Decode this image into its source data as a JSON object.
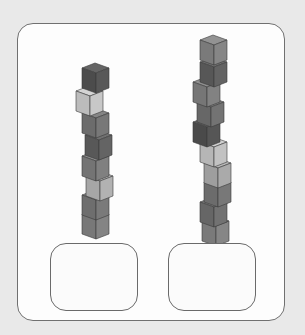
{
  "worksheet": {
    "towers": [
      {
        "name": "left-tower",
        "count": 8,
        "cubes": [
          {
            "x": 82,
            "y": 63,
            "shade": "#4c4c4c"
          },
          {
            "x": 76,
            "y": 86,
            "shade": "#bcbcbc"
          },
          {
            "x": 82,
            "y": 108,
            "shade": "#6c6c6c"
          },
          {
            "x": 85,
            "y": 130,
            "shade": "#585858"
          },
          {
            "x": 82,
            "y": 151,
            "shade": "#747474"
          },
          {
            "x": 86,
            "y": 171,
            "shade": "#a6a6a6"
          },
          {
            "x": 82,
            "y": 190,
            "shade": "#6e6e6e"
          },
          {
            "x": 82,
            "y": 209,
            "shade": "#787878"
          }
        ]
      },
      {
        "name": "right-tower",
        "count": 10,
        "cubes": [
          {
            "x": 200,
            "y": 35,
            "shade": "#7a7a7a"
          },
          {
            "x": 200,
            "y": 57,
            "shade": "#575757"
          },
          {
            "x": 193,
            "y": 77,
            "shade": "#767676"
          },
          {
            "x": 197,
            "y": 97,
            "shade": "#676767"
          },
          {
            "x": 193,
            "y": 117,
            "shade": "#4a4a4a"
          },
          {
            "x": 200,
            "y": 137,
            "shade": "#b6b6b6"
          },
          {
            "x": 204,
            "y": 158,
            "shade": "#9e9e9e"
          },
          {
            "x": 204,
            "y": 177,
            "shade": "#6c6c6c"
          },
          {
            "x": 200,
            "y": 197,
            "shade": "#666666"
          },
          {
            "x": 202,
            "y": 216,
            "shade": "#7a7a7a"
          }
        ]
      }
    ],
    "answer_boxes": [
      {
        "name": "left-answer-box",
        "value": ""
      },
      {
        "name": "right-answer-box",
        "value": ""
      }
    ],
    "colors": {
      "background": "#e9e9e9",
      "frame": "#fdfdfd",
      "frame_border": "#707070"
    }
  }
}
